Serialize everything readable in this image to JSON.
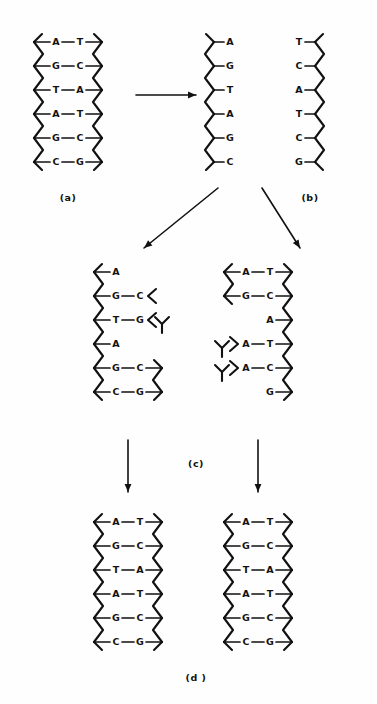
{
  "figure": {
    "ink_color": "#111111",
    "background_color": "#fefefe"
  },
  "labels": {
    "a": "(a)",
    "b": "(b)",
    "c": "(c)",
    "d": "(d )"
  },
  "panels": {
    "a": {
      "caption": "(a)",
      "type": "duplex",
      "rows": [
        {
          "left": "A",
          "right": "T",
          "paired": true
        },
        {
          "left": "G",
          "right": "C",
          "paired": true
        },
        {
          "left": "T",
          "right": "A",
          "paired": true
        },
        {
          "left": "A",
          "right": "T",
          "paired": true
        },
        {
          "left": "G",
          "right": "C",
          "paired": true
        },
        {
          "left": "C",
          "right": "G",
          "paired": true
        }
      ]
    },
    "b_left": {
      "caption": "",
      "type": "single-strand",
      "bases": [
        "A",
        "G",
        "T",
        "A",
        "G",
        "C"
      ]
    },
    "b_right": {
      "caption": "(b)",
      "type": "single-strand",
      "bases": [
        "T",
        "C",
        "A",
        "T",
        "C",
        "G"
      ]
    },
    "c_left": {
      "caption": "",
      "type": "replicating-duplex",
      "rows": [
        {
          "left": "A",
          "right": "",
          "paired": false,
          "right_backbone": false,
          "free_fragment": false
        },
        {
          "left": "G",
          "right": "C",
          "paired": true,
          "right_backbone": false,
          "free_fragment": false
        },
        {
          "left": "T",
          "right": "G",
          "paired": true,
          "right_backbone": false,
          "free_fragment": true,
          "mismatch": true
        },
        {
          "left": "A",
          "right": "",
          "paired": false,
          "right_backbone": false,
          "free_fragment": false
        },
        {
          "left": "G",
          "right": "C",
          "paired": true,
          "right_backbone": true,
          "free_fragment": false
        },
        {
          "left": "C",
          "right": "G",
          "paired": true,
          "right_backbone": true,
          "free_fragment": false
        }
      ]
    },
    "c_right": {
      "caption": "",
      "type": "replicating-duplex",
      "rows": [
        {
          "left": "A",
          "right": "T",
          "paired": true,
          "left_backbone": true,
          "free_fragment": false
        },
        {
          "left": "G",
          "right": "C",
          "paired": true,
          "left_backbone": true,
          "free_fragment": false
        },
        {
          "left": "",
          "right": "A",
          "paired": false,
          "left_backbone": false,
          "free_fragment": false
        },
        {
          "left": "A",
          "right": "T",
          "paired": true,
          "left_backbone": false,
          "free_fragment": true
        },
        {
          "left": "A",
          "right": "C",
          "paired": true,
          "left_backbone": false,
          "free_fragment": true,
          "mismatch": true
        },
        {
          "left": "",
          "right": "G",
          "paired": false,
          "left_backbone": false,
          "free_fragment": false
        }
      ]
    },
    "d_left": {
      "caption": "",
      "type": "duplex",
      "rows": [
        {
          "left": "A",
          "right": "T",
          "paired": true
        },
        {
          "left": "G",
          "right": "C",
          "paired": true
        },
        {
          "left": "T",
          "right": "A",
          "paired": true
        },
        {
          "left": "A",
          "right": "T",
          "paired": true
        },
        {
          "left": "G",
          "right": "C",
          "paired": true
        },
        {
          "left": "C",
          "right": "G",
          "paired": true
        }
      ]
    },
    "d_right": {
      "caption": "(d )",
      "type": "duplex",
      "rows": [
        {
          "left": "A",
          "right": "T",
          "paired": true
        },
        {
          "left": "G",
          "right": "C",
          "paired": true
        },
        {
          "left": "T",
          "right": "A",
          "paired": true
        },
        {
          "left": "A",
          "right": "T",
          "paired": true
        },
        {
          "left": "G",
          "right": "C",
          "paired": true
        },
        {
          "left": "C",
          "right": "G",
          "paired": true
        }
      ]
    }
  },
  "arrows": [
    {
      "name": "arrow-a-to-b",
      "direction": "right"
    },
    {
      "name": "arrow-b-left-to-c-left",
      "direction": "down-left"
    },
    {
      "name": "arrow-b-right-to-c-right",
      "direction": "down-right"
    },
    {
      "name": "arrow-c-left-to-d-left",
      "direction": "down"
    },
    {
      "name": "arrow-c-right-to-d-right",
      "direction": "down"
    }
  ]
}
